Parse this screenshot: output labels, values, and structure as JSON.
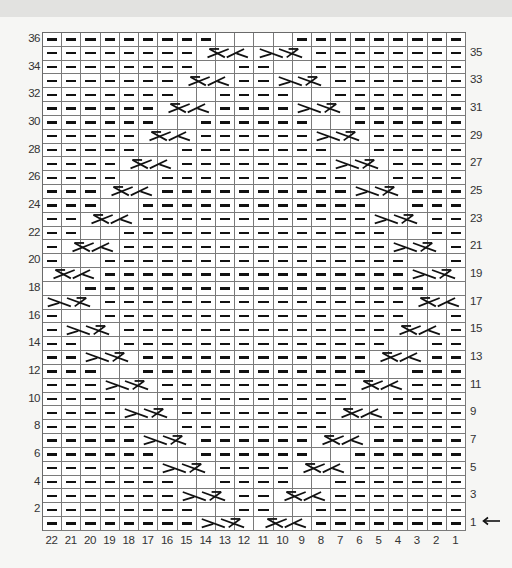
{
  "chart": {
    "columns": 22,
    "rows": 36,
    "column_labels": [
      "22",
      "21",
      "20",
      "19",
      "18",
      "17",
      "16",
      "15",
      "14",
      "13",
      "12",
      "11",
      "10",
      "9",
      "8",
      "7",
      "6",
      "5",
      "4",
      "3",
      "2",
      "1"
    ],
    "left_row_labels": [
      "36",
      "34",
      "32",
      "30",
      "28",
      "26",
      "24",
      "22",
      "20",
      "18",
      "16",
      "14",
      "12",
      "10",
      "8",
      "6",
      "4",
      "2"
    ],
    "right_row_labels": [
      "35",
      "33",
      "31",
      "29",
      "27",
      "25",
      "23",
      "21",
      "19",
      "17",
      "15",
      "13",
      "11",
      "9",
      "7",
      "5",
      "3",
      "1"
    ],
    "start_marker": "arrow-left-icon",
    "start_row": "1",
    "legend_symbols": {
      "purl": "dash (—) = purl on RS",
      "knit": "blank = knit",
      "cable_left": "3-st cable crossing moving left",
      "cable_right": "3-st cable crossing moving right"
    },
    "left_cable_columns_by_odd_row": {
      "1": [
        14,
        12
      ],
      "3": [
        15,
        13
      ],
      "5": [
        16,
        14
      ],
      "7": [
        17,
        15
      ],
      "9": [
        18,
        16
      ],
      "11": [
        19,
        17
      ],
      "13": [
        20,
        18
      ],
      "15": [
        21,
        19
      ],
      "17": [
        22,
        20
      ],
      "19": [
        22,
        20
      ],
      "21": [
        21,
        19
      ],
      "23": [
        20,
        18
      ],
      "25": [
        19,
        17
      ],
      "27": [
        18,
        16
      ],
      "29": [
        17,
        15
      ],
      "31": [
        16,
        14
      ],
      "33": [
        15,
        13
      ],
      "35": [
        14,
        12
      ]
    },
    "right_cable_columns_by_odd_row": {
      "1": [
        11,
        9
      ],
      "3": [
        10,
        8
      ],
      "5": [
        9,
        7
      ],
      "7": [
        8,
        6
      ],
      "9": [
        7,
        5
      ],
      "11": [
        6,
        4
      ],
      "13": [
        5,
        3
      ],
      "15": [
        4,
        2
      ],
      "17": [
        3,
        1
      ],
      "19": [
        3,
        1
      ],
      "21": [
        4,
        2
      ],
      "23": [
        5,
        3
      ],
      "25": [
        6,
        4
      ],
      "27": [
        7,
        5
      ],
      "29": [
        8,
        6
      ],
      "31": [
        9,
        7
      ],
      "33": [
        10,
        8
      ],
      "35": [
        11,
        9
      ]
    },
    "colors": {
      "background": "#f6f6f4",
      "grid_line": "#7a7a7a",
      "symbol": "#111111",
      "top_band": "#e2e2e0"
    }
  }
}
